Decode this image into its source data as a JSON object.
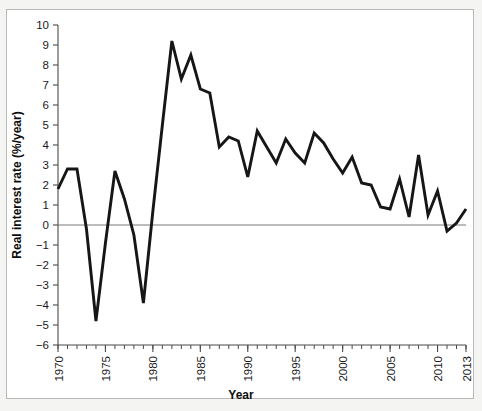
{
  "figure": {
    "background_color": "#f4f4f2",
    "panel_color": "#ffffff",
    "frame_color": "#b9b9b9",
    "line_color": "#161616",
    "axis_color": "#4a4a4a",
    "zero_line_color": "#7a7a7a"
  },
  "chart_data": {
    "type": "line",
    "title": "",
    "subtitle": "",
    "xlabel": "Year",
    "ylabel": "Real interest rate (%/year)",
    "xlim": [
      1970,
      2013
    ],
    "ylim": [
      -6,
      10
    ],
    "grid": false,
    "legend": null,
    "legend_position": "none",
    "zero_reference_line": 0,
    "x_major_tick_interval": 5,
    "x_minor_tick_interval": 1,
    "y_major_tick_interval": 1,
    "xticks": [
      1970,
      1975,
      1980,
      1985,
      1990,
      1995,
      2000,
      2005,
      2010,
      2013
    ],
    "xtick_labels": [
      "1970",
      "1975",
      "1980",
      "1985",
      "1990",
      "1995",
      "2000",
      "2005",
      "2010",
      "2013"
    ],
    "yticks": [
      -6,
      -5,
      -4,
      -3,
      -2,
      -1,
      0,
      1,
      2,
      3,
      4,
      5,
      6,
      7,
      8,
      9,
      10
    ],
    "ytick_labels": [
      "−6",
      "−5",
      "−4",
      "−3",
      "−2",
      "−1",
      "0",
      "1",
      "2",
      "3",
      "4",
      "5",
      "6",
      "7",
      "8",
      "9",
      "10"
    ],
    "x": [
      1970,
      1971,
      1972,
      1973,
      1974,
      1975,
      1976,
      1977,
      1978,
      1979,
      1980,
      1981,
      1982,
      1983,
      1984,
      1985,
      1986,
      1987,
      1988,
      1989,
      1990,
      1991,
      1992,
      1993,
      1994,
      1995,
      1996,
      1997,
      1998,
      1999,
      2000,
      2001,
      2002,
      2003,
      2004,
      2005,
      2006,
      2007,
      2008,
      2009,
      2010,
      2011,
      2012,
      2013
    ],
    "values": [
      1.8,
      2.8,
      2.8,
      -0.2,
      -4.8,
      -0.9,
      2.7,
      1.3,
      -0.5,
      -3.9,
      0.7,
      5.0,
      9.2,
      7.3,
      8.5,
      6.8,
      6.6,
      3.9,
      4.4,
      4.2,
      2.4,
      4.7,
      3.9,
      3.1,
      4.3,
      3.6,
      3.1,
      4.6,
      4.1,
      3.3,
      2.6,
      3.4,
      2.1,
      2.0,
      0.9,
      0.8,
      2.3,
      0.4,
      3.5,
      0.5,
      1.7,
      -0.3,
      0.1,
      0.8
    ],
    "series": [
      {
        "name": "Real interest rate",
        "values": [
          1.8,
          2.8,
          2.8,
          -0.2,
          -4.8,
          -0.9,
          2.7,
          1.3,
          -0.5,
          -3.9,
          0.7,
          5.0,
          9.2,
          7.3,
          8.5,
          6.8,
          6.6,
          3.9,
          4.4,
          4.2,
          2.4,
          4.7,
          3.9,
          3.1,
          4.3,
          3.6,
          3.1,
          4.6,
          4.1,
          3.3,
          2.6,
          3.4,
          2.1,
          2.0,
          0.9,
          0.8,
          2.3,
          0.4,
          3.5,
          0.5,
          1.7,
          -0.3,
          0.1,
          0.8
        ],
        "color": "#161616"
      }
    ],
    "annotations": []
  }
}
